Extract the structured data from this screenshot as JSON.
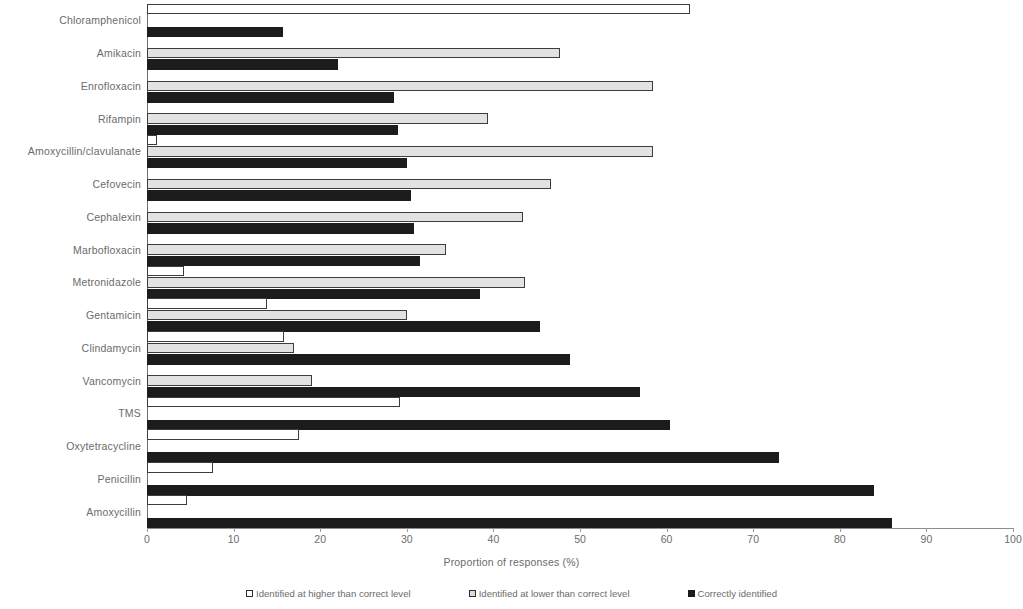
{
  "chart_data": {
    "type": "bar",
    "orientation": "horizontal",
    "title": "",
    "xlabel": "Proportion of responses (%)",
    "ylabel": "",
    "xlim": [
      0,
      100
    ],
    "xticks": [
      0,
      10,
      20,
      30,
      40,
      50,
      60,
      70,
      80,
      90,
      100
    ],
    "grid": false,
    "legend_position": "bottom",
    "categories": [
      "Chloramphenicol",
      "Amikacin",
      "Enrofloxacin",
      "Rifampin",
      "Amoxycillin/clavulanate",
      "Cefovecin",
      "Cephalexin",
      "Marbofloxacin",
      "Metronidazole",
      "Gentamicin",
      "Clindamycin",
      "Vancomycin",
      "TMS",
      "Oxytetracycline",
      "Penicillin",
      "Amoxycillin"
    ],
    "series": [
      {
        "name": "Identified at higher than correct level",
        "key": "higher",
        "color": "#ffffff",
        "values": [
          62.7,
          0,
          0,
          0,
          1.2,
          0,
          0,
          0,
          4.3,
          13.8,
          15.8,
          0,
          29.2,
          17.6,
          7.6,
          4.6
        ]
      },
      {
        "name": "Identified at lower than correct level",
        "key": "lower",
        "color": "#e2e2e2",
        "values": [
          0,
          47.7,
          58.4,
          39.4,
          58.4,
          46.6,
          43.4,
          34.5,
          43.6,
          30.0,
          17.0,
          19.0,
          0,
          0,
          0,
          0
        ]
      },
      {
        "name": "Correctly identified",
        "key": "correct",
        "color": "#1c1c1c",
        "values": [
          15.7,
          22.0,
          28.5,
          29.0,
          30.0,
          30.5,
          30.8,
          31.5,
          38.5,
          45.4,
          48.8,
          56.9,
          60.4,
          73.0,
          84.0,
          86.0
        ]
      }
    ]
  }
}
